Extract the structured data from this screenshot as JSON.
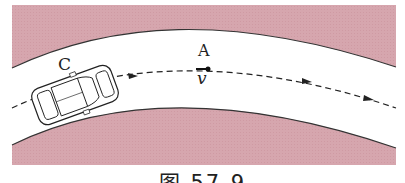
{
  "figure": {
    "caption": "图 57-9",
    "labels": {
      "car": "C",
      "point": "A",
      "velocity": "v"
    },
    "colors": {
      "ground": "#d9a9b0",
      "road": "#ffffff",
      "edge": "#333333",
      "path": "#222222"
    },
    "elements": [
      "curved road (arch)",
      "car at C",
      "dashed trajectory with arrows",
      "point A with velocity v"
    ]
  }
}
